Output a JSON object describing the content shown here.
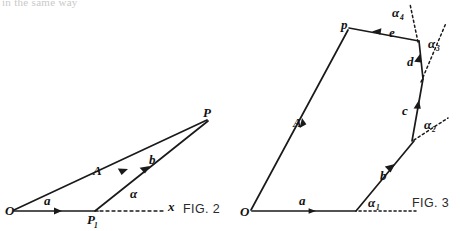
{
  "page": {
    "background_color": "#ffffff",
    "ink_color": "#1a1a1a",
    "width": 460,
    "height": 231,
    "cropped_top_text": "in the same way"
  },
  "figures": [
    {
      "id": "fig2",
      "caption": "FIG. 2",
      "description": "Vector triangle: resultant A from O to P, with components a (O to P1) and b (P1 to P), angle alpha measured from the dashed x axis at P1.",
      "points": {
        "O": {
          "label": "O",
          "x": 12,
          "y": 211
        },
        "P1": {
          "label": "P",
          "subscript": "1",
          "x": 92,
          "y": 211
        },
        "P": {
          "label": "P",
          "x": 209,
          "y": 121
        }
      },
      "vectors": [
        {
          "name": "a",
          "label": "a",
          "from": "O",
          "to": "P1",
          "label_x": 48,
          "label_y": 204
        },
        {
          "name": "b",
          "label": "b",
          "from": "P1",
          "to": "P",
          "label_x": 152,
          "label_y": 162
        },
        {
          "name": "A",
          "label": "A",
          "from": "O",
          "to": "P",
          "label_x": 96,
          "label_y": 172
        }
      ],
      "angles": [
        {
          "name": "alpha",
          "label": "α",
          "subscript": "",
          "x": 135,
          "y": 194
        }
      ],
      "axis": {
        "label": "x",
        "x": 172,
        "y": 205,
        "dashed": true
      }
    },
    {
      "id": "fig3",
      "caption": "FIG. 3",
      "description": "Open polygon of successive vectors a, b, c, d, e summing to resultant A from O to p; exterior angles alpha1..alpha4 measured from dashed extension lines.",
      "points": {
        "O": {
          "label": "O",
          "x": 250,
          "y": 211
        },
        "v1": {
          "x": 355,
          "y": 211
        },
        "v2": {
          "x": 413,
          "y": 141
        },
        "v3": {
          "x": 423,
          "y": 78
        },
        "v4": {
          "x": 420,
          "y": 40
        },
        "v5": {
          "x": 390,
          "y": 24
        },
        "p": {
          "label": "p",
          "x": 345,
          "y": 31
        }
      },
      "vectors": [
        {
          "name": "a",
          "label": "a",
          "label_x": 303,
          "label_y": 204
        },
        {
          "name": "b",
          "label": "b",
          "label_x": 384,
          "label_y": 177
        },
        {
          "name": "c",
          "label": "c",
          "label_x": 408,
          "label_y": 113
        },
        {
          "name": "d",
          "label": "d",
          "label_x": 415,
          "label_y": 63
        },
        {
          "name": "e",
          "label": "e",
          "label_x": 392,
          "label_y": 35
        },
        {
          "name": "A",
          "label": "A",
          "label_x": 297,
          "label_y": 124
        }
      ],
      "angles": [
        {
          "name": "alpha1",
          "label": "α",
          "subscript": "1",
          "x": 373,
          "y": 203
        },
        {
          "name": "alpha2",
          "label": "α",
          "subscript": "2",
          "x": 428,
          "y": 126
        },
        {
          "name": "alpha3",
          "label": "α",
          "subscript": "3",
          "x": 435,
          "y": 45
        },
        {
          "name": "alpha4",
          "label": "α",
          "subscript": "4",
          "x": 400,
          "y": 15
        }
      ]
    }
  ],
  "captions": {
    "fig2": "FIG. 2",
    "fig3": "FIG. 3"
  },
  "labels": {
    "fig2_O": "O",
    "fig2_P": "P",
    "fig2_P1_base": "P",
    "fig2_P1_sub": "1",
    "fig2_a": "a",
    "fig2_b": "b",
    "fig2_A": "A",
    "fig2_alpha": "α",
    "fig2_x": "x",
    "fig3_O": "O",
    "fig3_p": "p",
    "fig3_a": "a",
    "fig3_b": "b",
    "fig3_c": "c",
    "fig3_d": "d",
    "fig3_e": "e",
    "fig3_A": "A",
    "fig3_alpha": "α",
    "fig3_alpha1_sub": "1",
    "fig3_alpha2_sub": "2",
    "fig3_alpha3_sub": "3",
    "fig3_alpha4_sub": "4"
  }
}
